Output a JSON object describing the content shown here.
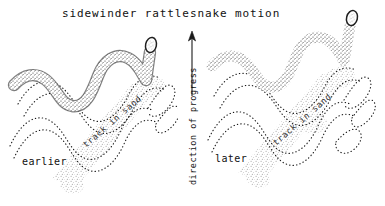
{
  "figure": {
    "title": "sidewinder rattlesnake motion",
    "background_color": "#ffffff",
    "ink_color": "#1a1a1a",
    "sand_color": "#9a9a9a",
    "width": 385,
    "height": 206
  },
  "axis": {
    "label": "direction of progress",
    "arrow_direction": "up",
    "arrow_icon": "arrow-up-icon"
  },
  "panels": [
    {
      "id": "earlier",
      "label": "earlier",
      "track_label": "track in sand",
      "snake": {
        "name": "sidewinder-rattlesnake",
        "body_texture": "stippled",
        "head_position": "upper-right",
        "tail_position": "lower-left"
      }
    },
    {
      "id": "later",
      "label": "later",
      "track_label": "track in sand",
      "snake": {
        "name": "sidewinder-rattlesnake",
        "body_texture": "stippled",
        "head_position": "upper-right",
        "tail_position": "lower-left"
      }
    }
  ]
}
